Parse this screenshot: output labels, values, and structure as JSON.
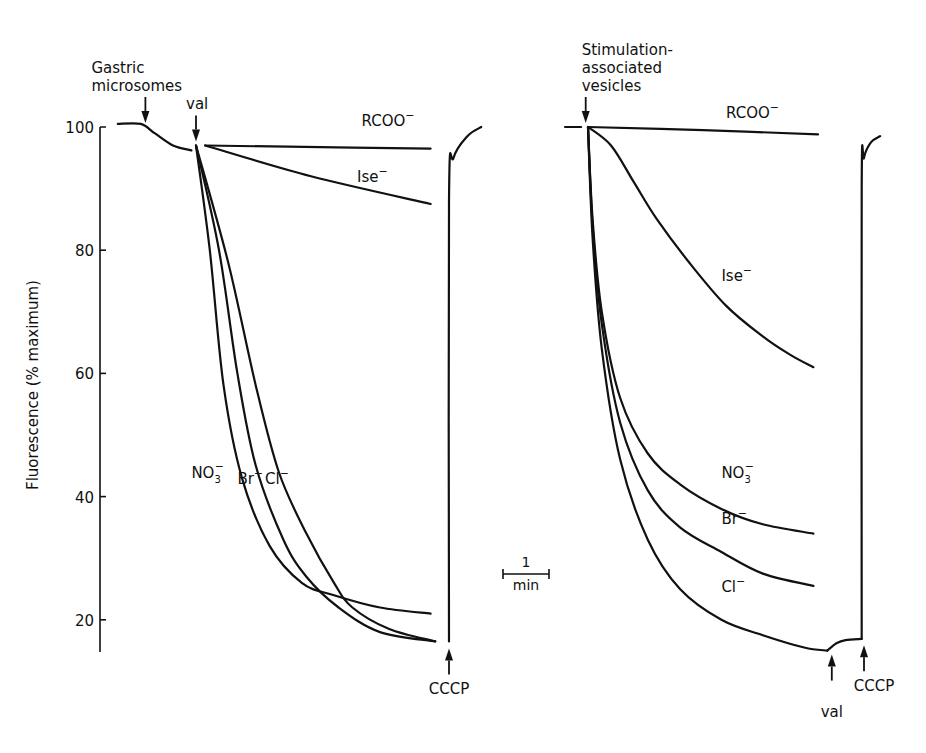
{
  "chart_data": [
    {
      "type": "line",
      "panel": "left",
      "title": "",
      "ylabel": "Fluorescence (% maximum)",
      "xlabel": "",
      "ylim": [
        15,
        100
      ],
      "yticks": [
        100,
        80,
        60,
        40,
        20
      ],
      "x_units": "min (relative to valinomycin addition)",
      "annotations": [
        {
          "text_lines": [
            "Gastric",
            "microsomes"
          ],
          "arrow": "down",
          "x": -1.1,
          "y": 100
        },
        {
          "text_lines": [
            "val"
          ],
          "arrow": "down",
          "x": 0,
          "y": 97
        },
        {
          "text_lines": [
            "CCCP"
          ],
          "arrow": "up",
          "x": 5.5,
          "y": 16
        }
      ],
      "baseline": {
        "name": "pre-val",
        "points": [
          [
            -1.7,
            100.5
          ],
          [
            -1.2,
            100.5
          ],
          [
            -0.9,
            99
          ],
          [
            -0.5,
            97
          ],
          [
            -0.1,
            96.2
          ]
        ]
      },
      "series": [
        {
          "name": "RCOO⁻",
          "label_pos": [
            3.6,
            100.2
          ],
          "points": [
            [
              0.2,
              97
            ],
            [
              2,
              96.8
            ],
            [
              5.1,
              96.5
            ]
          ]
        },
        {
          "name": "Ise⁻",
          "label_pos": [
            3.5,
            91
          ],
          "points": [
            [
              0.2,
              97
            ],
            [
              2.5,
              92
            ],
            [
              5.1,
              87.5
            ]
          ]
        },
        {
          "name": "NO₃⁻",
          "label_pos": [
            -0.1,
            43
          ],
          "points": [
            [
              0,
              97
            ],
            [
              0.3,
              80
            ],
            [
              0.6,
              58
            ],
            [
              1.0,
              43
            ],
            [
              1.6,
              32
            ],
            [
              2.3,
              26
            ],
            [
              3.0,
              24
            ],
            [
              4.0,
              22
            ],
            [
              5.1,
              21
            ]
          ]
        },
        {
          "name": "Br⁻",
          "label_pos": [
            0.9,
            42
          ],
          "points": [
            [
              0,
              97
            ],
            [
              0.5,
              80
            ],
            [
              0.9,
              60
            ],
            [
              1.3,
              45
            ],
            [
              1.9,
              33
            ],
            [
              2.4,
              27
            ],
            [
              3.1,
              22
            ],
            [
              4.0,
              18
            ],
            [
              5.2,
              16.5
            ]
          ]
        },
        {
          "name": "Cl⁻",
          "label_pos": [
            1.5,
            42
          ],
          "points": [
            [
              0,
              97
            ],
            [
              0.7,
              78
            ],
            [
              1.3,
              58
            ],
            [
              1.8,
              44
            ],
            [
              2.4,
              34
            ],
            [
              3.0,
              26
            ],
            [
              3.4,
              22
            ],
            [
              4.2,
              18.5
            ],
            [
              5.2,
              16.5
            ]
          ]
        }
      ],
      "recovery": {
        "name": "CCCP recovery",
        "points": [
          [
            5.5,
            16.5
          ],
          [
            5.5,
            88
          ],
          [
            5.6,
            95
          ],
          [
            5.9,
            98.5
          ],
          [
            6.2,
            100
          ]
        ]
      }
    },
    {
      "type": "line",
      "panel": "right",
      "title": "",
      "ylabel": "",
      "xlabel": "",
      "ylim": [
        15,
        100
      ],
      "x_units": "min (relative to vesicle addition)",
      "annotations": [
        {
          "text_lines": [
            "Stimulation-",
            "associated",
            "vesicles"
          ],
          "arrow": "down",
          "x": -0.05,
          "y": 100
        },
        {
          "text_lines": [
            "val"
          ],
          "arrow": "up",
          "x": 5.3,
          "y": 15
        },
        {
          "text_lines": [
            "CCCP"
          ],
          "arrow": "up",
          "x": 6.0,
          "y": 16.5
        }
      ],
      "baseline": {
        "name": "pre-addition",
        "points": [
          [
            -0.5,
            100
          ],
          [
            -0.15,
            100
          ]
        ]
      },
      "series": [
        {
          "name": "RCOO⁻",
          "label_pos": [
            3.0,
            101.5
          ],
          "points": [
            [
              0,
              100
            ],
            [
              2.5,
              99.5
            ],
            [
              5.0,
              98.8
            ]
          ]
        },
        {
          "name": "Ise⁻",
          "label_pos": [
            2.9,
            75
          ],
          "points": [
            [
              0,
              100
            ],
            [
              0.5,
              97
            ],
            [
              1.0,
              91
            ],
            [
              1.5,
              85
            ],
            [
              2.2,
              78
            ],
            [
              3.0,
              71
            ],
            [
              3.8,
              66
            ],
            [
              4.4,
              63
            ],
            [
              4.9,
              61
            ]
          ]
        },
        {
          "name": "NO₃⁻",
          "label_pos": [
            2.9,
            43
          ],
          "points": [
            [
              0,
              100
            ],
            [
              0.1,
              85
            ],
            [
              0.3,
              70
            ],
            [
              0.7,
              56
            ],
            [
              1.3,
              47
            ],
            [
              2.0,
              42
            ],
            [
              2.9,
              38
            ],
            [
              3.8,
              35.5
            ],
            [
              4.9,
              34
            ]
          ]
        },
        {
          "name": "Br⁻",
          "label_pos": [
            2.9,
            35.5
          ],
          "points": [
            [
              0,
              100
            ],
            [
              0.1,
              84
            ],
            [
              0.3,
              68
            ],
            [
              0.7,
              52
            ],
            [
              1.3,
              41
            ],
            [
              2.0,
              35
            ],
            [
              2.9,
              31
            ],
            [
              3.8,
              27.5
            ],
            [
              4.9,
              25.5
            ]
          ]
        },
        {
          "name": "Cl⁻",
          "label_pos": [
            2.9,
            24.5
          ],
          "points": [
            [
              0,
              100
            ],
            [
              0.1,
              82
            ],
            [
              0.3,
              64
            ],
            [
              0.7,
              46
            ],
            [
              1.3,
              33
            ],
            [
              2.0,
              25
            ],
            [
              2.9,
              20
            ],
            [
              3.8,
              17.5
            ],
            [
              4.7,
              15.5
            ],
            [
              5.2,
              15
            ]
          ]
        }
      ],
      "post_val": {
        "name": "after val",
        "points": [
          [
            5.2,
            15
          ],
          [
            5.4,
            16.2
          ],
          [
            5.6,
            16.7
          ],
          [
            5.95,
            16.9
          ]
        ]
      },
      "recovery": {
        "name": "CCCP recovery",
        "points": [
          [
            5.95,
            16.9
          ],
          [
            5.95,
            90
          ],
          [
            6.0,
            95
          ],
          [
            6.15,
            97.5
          ],
          [
            6.35,
            98.5
          ]
        ]
      }
    }
  ],
  "scale_bar": {
    "value": "1",
    "unit": "min",
    "minutes": 1
  }
}
